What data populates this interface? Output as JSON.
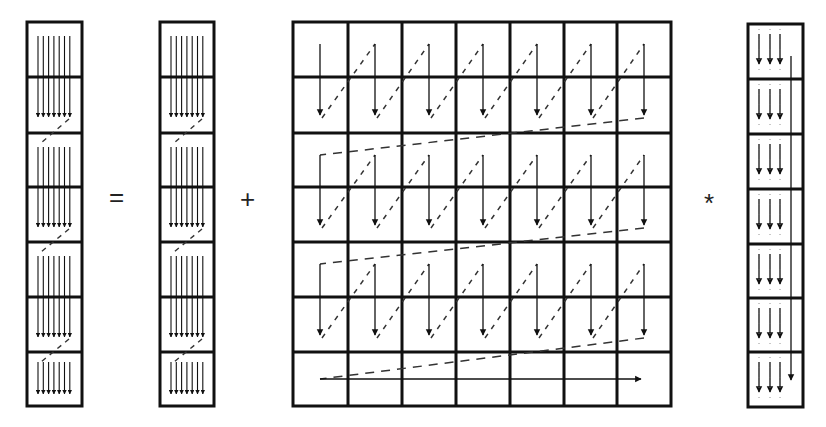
{
  "diagram": {
    "operators": {
      "equals": "=",
      "plus": "+",
      "times": "*"
    },
    "left_vector": {
      "blocks": 7,
      "role": "result vector y"
    },
    "middle_vector": {
      "blocks": 7,
      "role": "input vector y"
    },
    "matrix": {
      "rows": 7,
      "cols": 7,
      "role": "matrix A",
      "traversal": "column-wise down within block pairs, dashed diagonal jumps, final horizontal arrow across last row"
    },
    "right_vector": {
      "blocks": 7,
      "role": "vector x"
    },
    "colors": {
      "line": "#111111",
      "background": "#ffffff",
      "dash": "#333333"
    }
  }
}
